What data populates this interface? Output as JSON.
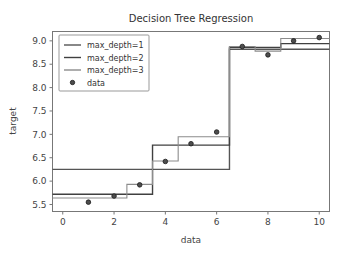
{
  "chart_data": {
    "type": "line",
    "title": "Decision Tree Regression",
    "xlabel": "data",
    "ylabel": "target",
    "xlim": [
      -0.4,
      10.4
    ],
    "ylim": [
      5.35,
      9.2
    ],
    "grid": false,
    "legend_position": "upper left",
    "xticks": [
      "0",
      "2",
      "4",
      "6",
      "8",
      "10"
    ],
    "xtick_values": [
      0,
      2,
      4,
      6,
      8,
      10
    ],
    "yticks": [
      "5.5",
      "6.0",
      "6.5",
      "7.0",
      "7.5",
      "8.0",
      "8.5",
      "9.0"
    ],
    "ytick_values": [
      5.5,
      6.0,
      6.5,
      7.0,
      7.5,
      8.0,
      8.5,
      9.0
    ],
    "scatter": {
      "name": "data",
      "marker": "o",
      "color": "#4d4d4d",
      "x": [
        1,
        2,
        3,
        4,
        5,
        6,
        7,
        8,
        9,
        10
      ],
      "y": [
        5.55,
        5.68,
        5.92,
        6.42,
        6.8,
        7.05,
        8.88,
        8.7,
        9.0,
        9.07
      ]
    },
    "series": [
      {
        "name": "max_depth=1",
        "color": "#555555",
        "width": 1.4,
        "step_x": [
          -0.4,
          6.5,
          6.5,
          10.4
        ],
        "step_y": [
          6.25,
          6.25,
          8.82,
          8.82
        ]
      },
      {
        "name": "max_depth=2",
        "color": "#404040",
        "width": 1.4,
        "step_x": [
          -0.4,
          3.5,
          3.5,
          6.5,
          6.5,
          8.5,
          8.5,
          10.4
        ],
        "step_y": [
          5.72,
          5.72,
          6.77,
          6.77,
          8.86,
          8.86,
          8.94,
          8.94
        ]
      },
      {
        "name": "max_depth=3",
        "color": "#8c8c8c",
        "width": 1.1,
        "step_x": [
          -0.4,
          2.5,
          2.5,
          3.5,
          3.5,
          4.5,
          4.5,
          6.5,
          6.5,
          7.5,
          7.5,
          8.5,
          8.5,
          10.4
        ],
        "step_y": [
          5.64,
          5.64,
          5.93,
          5.93,
          6.43,
          6.43,
          6.95,
          6.95,
          8.88,
          8.88,
          8.78,
          8.78,
          9.05,
          9.05
        ]
      }
    ],
    "legend_entries": [
      {
        "label": "max_depth=1",
        "type": "line",
        "color": "#555555"
      },
      {
        "label": "max_depth=2",
        "type": "line",
        "color": "#404040"
      },
      {
        "label": "max_depth=3",
        "type": "line",
        "color": "#8c8c8c"
      },
      {
        "label": "data",
        "type": "marker",
        "color": "#4d4d4d"
      }
    ]
  }
}
